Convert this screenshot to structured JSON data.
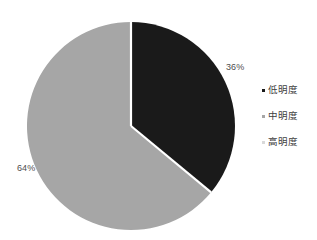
{
  "chart_data": {
    "type": "pie",
    "title": "",
    "categories": [
      "低明度",
      "中明度",
      "高明度"
    ],
    "values": [
      36,
      64,
      0
    ],
    "labels": [
      "36%",
      "64%"
    ],
    "label_positions": [
      "outside-right-top",
      "outside-left-bottom"
    ],
    "colors": [
      "#1a1a1a",
      "#a6a6a6",
      "#d9d9d9"
    ],
    "start_angle_deg": 0,
    "direction": "clockwise",
    "legend_position": "right",
    "separator_color": "#ffffff",
    "background": "#ffffff",
    "units": "percent"
  },
  "legend": {
    "items": [
      {
        "label": "低明度",
        "color": "#1a1a1a",
        "marker": "square-marker"
      },
      {
        "label": "中明度",
        "color": "#a6a6a6",
        "marker": "square-marker"
      },
      {
        "label": "高明度",
        "color": "#d9d9d9",
        "marker": "square-marker"
      }
    ]
  },
  "geometry": {
    "center_x": 131,
    "center_y": 126,
    "radius": 104
  }
}
